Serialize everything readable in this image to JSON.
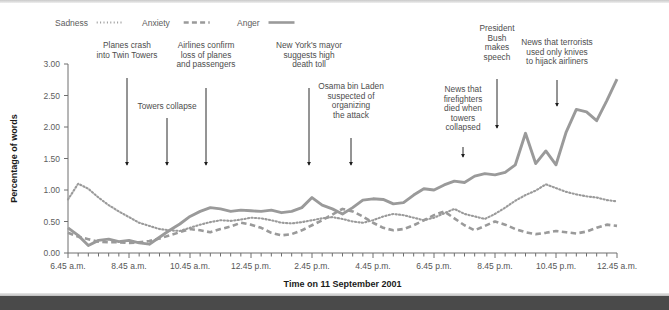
{
  "chart_data": {
    "type": "line",
    "title": "",
    "xlabel": "Time on 11 September 2001",
    "ylabel": "Percentage of words",
    "ylim": [
      0.0,
      3.0
    ],
    "yticks": [
      "0.00",
      "0.50",
      "1.00",
      "1.50",
      "2.00",
      "2.50",
      "3.00"
    ],
    "grid": false,
    "legend_position": "top-left",
    "x_tick_labels": [
      "6.45 a.m.",
      "8.45 a.m.",
      "10.45 a.m.",
      "12.45 p.m.",
      "2.45 p.m.",
      "4.45 p.m.",
      "6.45 p.m.",
      "8.45 p.m.",
      "10.45 p.m.",
      "12.45 a.m."
    ],
    "x_minor_tick_interval_minutes": 30,
    "x_range_hours": [
      6.75,
      24.75
    ],
    "series": [
      {
        "name": "Sadness",
        "style": "dotted",
        "color": "#9a9a9a",
        "values": [
          0.85,
          1.1,
          1.02,
          0.88,
          0.76,
          0.66,
          0.57,
          0.48,
          0.43,
          0.38,
          0.36,
          0.35,
          0.4,
          0.45,
          0.49,
          0.52,
          0.51,
          0.53,
          0.56,
          0.55,
          0.52,
          0.48,
          0.47,
          0.49,
          0.52,
          0.55,
          0.57,
          0.54,
          0.5,
          0.48,
          0.52,
          0.58,
          0.62,
          0.6,
          0.56,
          0.52,
          0.56,
          0.63,
          0.7,
          0.62,
          0.58,
          0.54,
          0.62,
          0.72,
          0.83,
          0.92,
          0.99,
          1.09,
          1.03,
          0.97,
          0.93,
          0.9,
          0.88,
          0.84,
          0.82
        ]
      },
      {
        "name": "Anxiety",
        "style": "dashed",
        "color": "#9a9a9a",
        "values": [
          0.32,
          0.26,
          0.22,
          0.18,
          0.17,
          0.17,
          0.16,
          0.17,
          0.19,
          0.23,
          0.28,
          0.33,
          0.38,
          0.36,
          0.33,
          0.38,
          0.42,
          0.48,
          0.45,
          0.4,
          0.32,
          0.28,
          0.3,
          0.36,
          0.44,
          0.52,
          0.61,
          0.7,
          0.66,
          0.58,
          0.48,
          0.4,
          0.36,
          0.38,
          0.44,
          0.52,
          0.6,
          0.66,
          0.55,
          0.44,
          0.36,
          0.43,
          0.5,
          0.45,
          0.38,
          0.33,
          0.3,
          0.32,
          0.35,
          0.33,
          0.31,
          0.34,
          0.4,
          0.45,
          0.43
        ]
      },
      {
        "name": "Anger",
        "style": "solid",
        "color": "#9a9a9a",
        "values": [
          0.4,
          0.28,
          0.12,
          0.2,
          0.22,
          0.18,
          0.2,
          0.16,
          0.14,
          0.25,
          0.36,
          0.46,
          0.58,
          0.66,
          0.72,
          0.7,
          0.66,
          0.68,
          0.67,
          0.66,
          0.68,
          0.64,
          0.66,
          0.72,
          0.88,
          0.76,
          0.7,
          0.62,
          0.72,
          0.84,
          0.86,
          0.85,
          0.78,
          0.8,
          0.92,
          1.02,
          1.0,
          1.08,
          1.14,
          1.12,
          1.22,
          1.26,
          1.24,
          1.28,
          1.4,
          1.9,
          1.42,
          1.62,
          1.4,
          1.92,
          2.28,
          2.24,
          2.1,
          2.42,
          2.76
        ]
      }
    ],
    "annotations": [
      {
        "text": "Planes crash\ninto Twin Towers",
        "time_index": 8
      },
      {
        "text": "Towers collapse",
        "time_index": 12
      },
      {
        "text": "Airlines confirm\nloss of planes\nand passengers",
        "time_index": 16
      },
      {
        "text": "New York's mayor\nsuggests high\ndeath toll",
        "time_index": 26
      },
      {
        "text": "Osama bin Laden\nsuspected of\norganizing\nthe attack",
        "time_index": 31
      },
      {
        "text": "News that\nfirefighters\ndied when\ntowers\ncollapsed",
        "time_index": 42
      },
      {
        "text": "President\nBush\nmakes\nspeech",
        "time_index": 45
      },
      {
        "text": "News that terrorists\nused only knives\nto hijack airliners",
        "time_index": 51
      }
    ]
  },
  "legend": {
    "items": [
      {
        "label": "Sadness",
        "style": "dotted"
      },
      {
        "label": "Anxiety",
        "style": "dashed"
      },
      {
        "label": "Anger",
        "style": "solid"
      }
    ]
  },
  "axes": {
    "x_title": "Time on 11 September 2001",
    "y_title": "Percentage of words"
  }
}
